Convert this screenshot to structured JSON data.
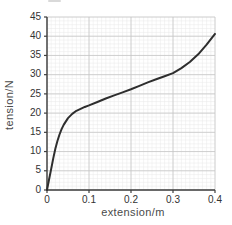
{
  "figure": {
    "x_axis_title": "extension/m",
    "y_axis_title": "tension/N"
  },
  "chart_data": {
    "type": "line",
    "title": "",
    "xlabel": "extension/m",
    "ylabel": "tension/N",
    "xlim": [
      0,
      0.4
    ],
    "ylim": [
      0,
      45
    ],
    "x_major_step": 0.1,
    "x_minor_step": 0.01,
    "y_major_step": 5,
    "y_minor_step": 1,
    "x_tick_labels": [
      "0",
      "0.1",
      "0.2",
      "0.3",
      "0.4"
    ],
    "y_tick_labels": [
      "0",
      "5",
      "10",
      "15",
      "20",
      "25",
      "30",
      "35",
      "40",
      "45"
    ],
    "grid": "major+minor",
    "legend": "none",
    "series": [
      {
        "name": "tension vs extension",
        "x": [
          0,
          0.005,
          0.01,
          0.015,
          0.02,
          0.025,
          0.03,
          0.035,
          0.04,
          0.05,
          0.06,
          0.07,
          0.08,
          0.09,
          0.1,
          0.12,
          0.14,
          0.16,
          0.18,
          0.2,
          0.22,
          0.24,
          0.26,
          0.28,
          0.3,
          0.32,
          0.34,
          0.36,
          0.38,
          0.4
        ],
        "y": [
          0,
          2.8,
          5.5,
          8.3,
          10.8,
          12.8,
          14.5,
          15.9,
          17,
          18.7,
          19.8,
          20.6,
          21.1,
          21.6,
          22,
          22.9,
          23.8,
          24.6,
          25.4,
          26.2,
          27.1,
          28,
          28.8,
          29.6,
          30.4,
          31.7,
          33.3,
          35.3,
          37.8,
          40.6
        ]
      }
    ],
    "colors": {
      "curve": "#2e2e2e",
      "axis": "#3f3f3f",
      "grid_minor": "#e8e8e8",
      "grid_major": "#c6c6c6",
      "tick_text": "#333333",
      "title_text": "#4a4a4a"
    }
  }
}
